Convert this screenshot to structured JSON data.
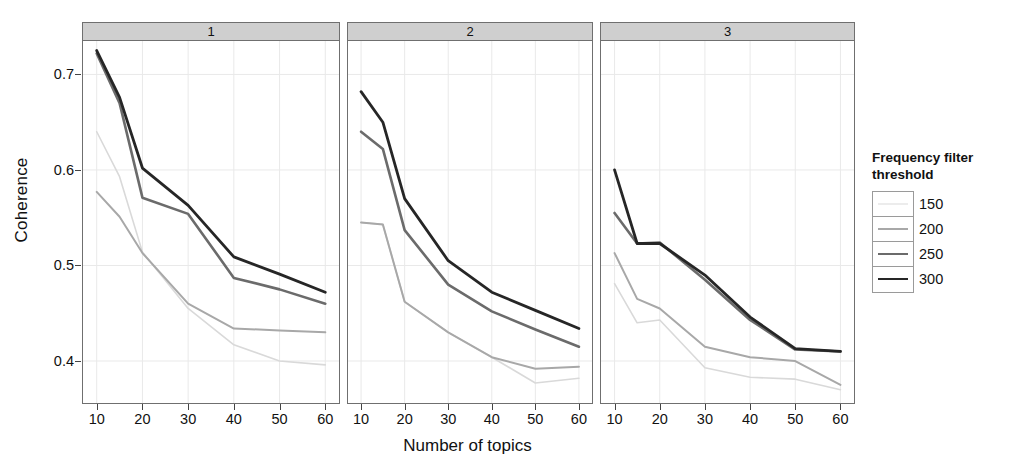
{
  "chart_data": {
    "type": "line",
    "title": "",
    "xlabel": "Number of topics",
    "ylabel": "Coherence",
    "x": [
      10,
      15,
      20,
      30,
      40,
      50,
      60
    ],
    "xlim": [
      7,
      63
    ],
    "ylim": [
      0.355,
      0.735
    ],
    "xticks": [
      10,
      20,
      30,
      40,
      50,
      60
    ],
    "yticks": [
      0.4,
      0.5,
      0.6,
      0.7
    ],
    "ytick_labels": [
      "0.4",
      "0.5",
      "0.6",
      "0.7"
    ],
    "xtick_labels": [
      "10",
      "20",
      "30",
      "40",
      "50",
      "60"
    ],
    "grid": true,
    "grid_color": "#e9e9e9",
    "legend_title": "Frequency filter threshold",
    "legend_position": "right",
    "facets": [
      {
        "label": "1",
        "series": [
          {
            "name": "150",
            "color": "#d9d9d9",
            "width": 1.6,
            "values": [
              0.64,
              0.593,
              0.514,
              0.455,
              0.417,
              0.4,
              0.396
            ]
          },
          {
            "name": "200",
            "color": "#a8a8a8",
            "width": 2.0,
            "values": [
              0.577,
              0.551,
              0.513,
              0.46,
              0.434,
              0.432,
              0.43
            ]
          },
          {
            "name": "250",
            "color": "#6b6b6b",
            "width": 2.6,
            "values": [
              0.722,
              0.67,
              0.571,
              0.554,
              0.487,
              0.475,
              0.46
            ]
          },
          {
            "name": "300",
            "color": "#262626",
            "width": 2.8,
            "values": [
              0.725,
              0.676,
              0.602,
              0.563,
              0.509,
              0.491,
              0.472
            ]
          }
        ]
      },
      {
        "label": "2",
        "series": [
          {
            "name": "150",
            "color": "#d9d9d9",
            "width": 1.6,
            "values": [
              0.545,
              0.543,
              0.462,
              0.43,
              0.404,
              0.377,
              0.382
            ]
          },
          {
            "name": "200",
            "color": "#a8a8a8",
            "width": 2.0,
            "values": [
              0.545,
              0.543,
              0.462,
              0.43,
              0.404,
              0.392,
              0.394
            ]
          },
          {
            "name": "250",
            "color": "#6b6b6b",
            "width": 2.6,
            "values": [
              0.64,
              0.622,
              0.537,
              0.48,
              0.452,
              0.433,
              0.415
            ]
          },
          {
            "name": "300",
            "color": "#262626",
            "width": 2.8,
            "values": [
              0.682,
              0.65,
              0.57,
              0.505,
              0.472,
              0.453,
              0.434
            ]
          }
        ]
      },
      {
        "label": "3",
        "series": [
          {
            "name": "150",
            "color": "#d9d9d9",
            "width": 1.6,
            "values": [
              0.481,
              0.44,
              0.443,
              0.393,
              0.383,
              0.381,
              0.37
            ]
          },
          {
            "name": "200",
            "color": "#a8a8a8",
            "width": 2.0,
            "values": [
              0.513,
              0.465,
              0.455,
              0.415,
              0.404,
              0.4,
              0.375
            ]
          },
          {
            "name": "250",
            "color": "#6b6b6b",
            "width": 2.6,
            "values": [
              0.555,
              0.523,
              0.524,
              0.485,
              0.443,
              0.412,
              0.41
            ]
          },
          {
            "name": "300",
            "color": "#262626",
            "width": 2.8,
            "values": [
              0.6,
              0.523,
              0.523,
              0.49,
              0.446,
              0.413,
              0.41
            ]
          }
        ]
      }
    ],
    "legend_entries": [
      {
        "label": "150",
        "color": "#d9d9d9",
        "width": 1.6
      },
      {
        "label": "200",
        "color": "#a8a8a8",
        "width": 2.0
      },
      {
        "label": "250",
        "color": "#6b6b6b",
        "width": 2.6
      },
      {
        "label": "300",
        "color": "#262626",
        "width": 2.8
      }
    ]
  }
}
